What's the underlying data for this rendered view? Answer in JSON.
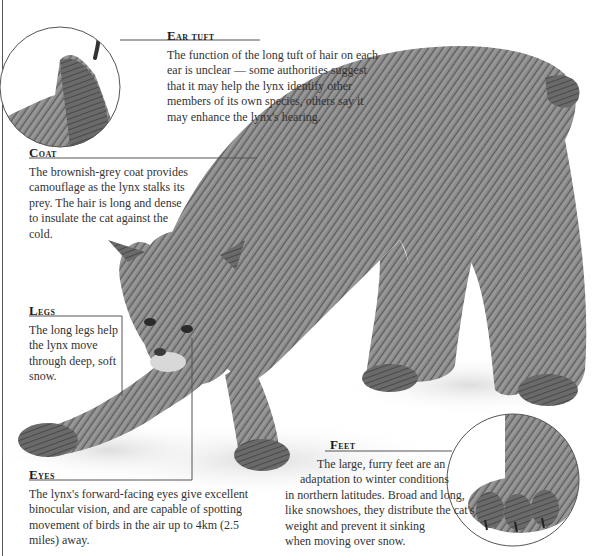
{
  "page": {
    "clipped_header_fragment": ""
  },
  "colors": {
    "text": "#333333",
    "heading": "#1a1a1a",
    "rule": "#555555",
    "fur_dark": "#5a5a5a",
    "fur_mid": "#8a8a8a",
    "snow_shadow": "#e4e4e4"
  },
  "illustration": {
    "subject": "lynx",
    "insets": [
      {
        "name": "ear-tuft-inset",
        "shape": "circle"
      },
      {
        "name": "foot-inset",
        "shape": "circle"
      }
    ]
  },
  "callouts": {
    "ear_tuft": {
      "title_cap": "E",
      "title_rest": "ar tuft",
      "body": "The function of the long tuft of hair on each ear is unclear — some authorities suggest that it may help the lynx identify other members of its own species, others say it may enhance the lynx's hearing."
    },
    "coat": {
      "title_cap": "C",
      "title_rest": "oat",
      "body": "The brownish-grey coat provides camouflage as the lynx stalks its prey. The hair is long and dense to insulate the cat against the cold."
    },
    "legs": {
      "title_cap": "L",
      "title_rest": "egs",
      "body": "The long legs help the lynx move through deep, soft snow."
    },
    "eyes": {
      "title_cap": "E",
      "title_rest": "yes",
      "body": "The lynx's forward-facing eyes give excellent binocular vision, and are capable of spotting movement of birds in the air up to 4km (2.5 miles) away."
    },
    "feet": {
      "title_cap": "F",
      "title_rest": "eet",
      "lines": [
        "The large, furry feet are an",
        "adaptation to winter conditions",
        "in northern latitudes. Broad and long,",
        "like snowshoes, they distribute the cat's",
        "weight and prevent it sinking",
        "when moving over snow."
      ]
    }
  }
}
